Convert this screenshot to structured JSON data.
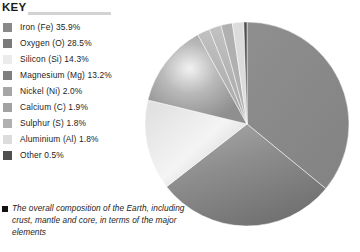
{
  "key": {
    "title": "KEY",
    "rule_color": "#d3d3d3"
  },
  "legend": {
    "items": [
      {
        "label": "Iron (Fe) 35.9%",
        "name": "Iron",
        "symbol": "Fe",
        "value": 35.9,
        "color": "#898989"
      },
      {
        "label": "Oxygen (O) 28.5%",
        "name": "Oxygen",
        "symbol": "O",
        "value": 28.5,
        "color": "#7a7a7a"
      },
      {
        "label": "Silicon (Si) 14.3%",
        "name": "Silicon",
        "symbol": "Si",
        "value": 14.3,
        "color": "#ebebeb"
      },
      {
        "label": "Magnesium (Mg) 13.2%",
        "name": "Magnesium",
        "symbol": "Mg",
        "value": 13.2,
        "color": "#7f7f7f"
      },
      {
        "label": "Nickel (Ni) 2.0%",
        "name": "Nickel",
        "symbol": "Ni",
        "value": 2.0,
        "color": "#a6a6a6"
      },
      {
        "label": "Calcium (C) 1.9%",
        "name": "Calcium",
        "symbol": "C",
        "value": 1.9,
        "color": "#a2a2a2"
      },
      {
        "label": "Sulphur (S) 1.8%",
        "name": "Sulphur",
        "symbol": "S",
        "value": 1.8,
        "color": "#b0b0b0"
      },
      {
        "label": "Aluminium (Al) 1.8%",
        "name": "Aluminium",
        "symbol": "Al",
        "value": 1.8,
        "color": "#dcdcdc"
      },
      {
        "label": "Other 0.5%",
        "name": "Other",
        "symbol": "",
        "value": 0.5,
        "color": "#4f4f4f"
      }
    ]
  },
  "caption": {
    "text": "The overall composition of the Earth, including crust, mantle and core, in terms of the major elements"
  },
  "chart_data": {
    "type": "pie",
    "title": "",
    "labels": [
      "Iron (Fe)",
      "Oxygen (O)",
      "Silicon (Si)",
      "Magnesium (Mg)",
      "Nickel (Ni)",
      "Calcium (C)",
      "Sulphur (S)",
      "Aluminium (Al)",
      "Other"
    ],
    "values": [
      35.9,
      28.5,
      14.3,
      13.2,
      2.0,
      1.9,
      1.8,
      1.8,
      0.5
    ],
    "unit": "%",
    "total": 99.9,
    "start_angle_deg": 0,
    "direction": "clockwise",
    "legend_position": "left",
    "grid": false,
    "slice_colors": [
      "#898989",
      "#7a7a7a",
      "#ebebeb",
      "#7f7f7f",
      "#a6a6a6",
      "#a2a2a2",
      "#b0b0b0",
      "#dcdcdc",
      "#4f4f4f"
    ],
    "center": {
      "x": 247,
      "y": 124
    },
    "radius": 102
  }
}
